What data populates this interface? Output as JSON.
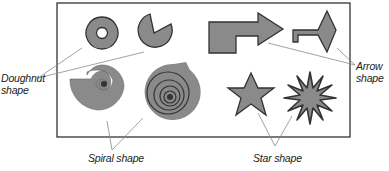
{
  "colors": {
    "fill": "#8a8a8a",
    "stroke": "#333333",
    "frame": "#333333",
    "leader": "#8a8a8a",
    "background": "#ffffff"
  },
  "labels": {
    "doughnut": {
      "line1": "Doughnut",
      "line2": "shape"
    },
    "arrow": {
      "line1": "Arrow",
      "line2": "shape"
    },
    "spiral": {
      "text": "Spiral shape"
    },
    "star": {
      "text": "Star shape"
    }
  },
  "shapes": [
    {
      "group": "doughnut",
      "name": "doughnut"
    },
    {
      "group": "doughnut",
      "name": "pie"
    },
    {
      "group": "arrow",
      "name": "bent-arrow"
    },
    {
      "group": "arrow",
      "name": "diamond-end-arrow"
    },
    {
      "group": "spiral",
      "name": "open-spiral"
    },
    {
      "group": "spiral",
      "name": "tight-spiral"
    },
    {
      "group": "star",
      "name": "five-point-star"
    },
    {
      "group": "star",
      "name": "twelve-point-star"
    }
  ]
}
